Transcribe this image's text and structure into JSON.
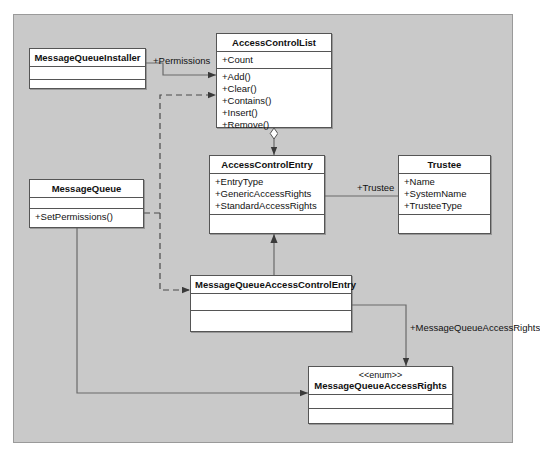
{
  "diagram": {
    "frame_color": "#c9c9c9",
    "box_fill": "#ffffff",
    "line_color": "#555555",
    "classes": [
      {
        "id": "message-queue-installer",
        "name": "MessageQueueInstaller",
        "stereotype": "",
        "attributes": [],
        "methods": []
      },
      {
        "id": "access-control-list",
        "name": "AccessControlList",
        "stereotype": "",
        "attributes": [
          "+Count"
        ],
        "methods": [
          "+Add()",
          "+Clear()",
          "+Contains()",
          "+Insert()",
          "+Remove()"
        ]
      },
      {
        "id": "access-control-entry",
        "name": "AccessControlEntry",
        "stereotype": "",
        "attributes": [
          "+EntryType",
          "+GenericAccessRights",
          "+StandardAccessRights"
        ],
        "methods": []
      },
      {
        "id": "trustee",
        "name": "Trustee",
        "stereotype": "",
        "attributes": [
          "+Name",
          "+SystemName",
          "+TrusteeType"
        ],
        "methods": []
      },
      {
        "id": "message-queue",
        "name": "MessageQueue",
        "stereotype": "",
        "attributes": [],
        "methods": [
          "+SetPermissions()"
        ]
      },
      {
        "id": "message-queue-access-control-entry",
        "name": "MessageQueueAccessControlEntry",
        "stereotype": "",
        "attributes": [],
        "methods": []
      },
      {
        "id": "message-queue-access-rights",
        "name": "MessageQueueAccessRights",
        "stereotype": "<<enum>>",
        "attributes": [],
        "methods": []
      }
    ],
    "edge_labels": {
      "permissions": "+Permissions",
      "trustee": "+Trustee",
      "access_rights": "+MessageQueueAccessRights"
    }
  }
}
